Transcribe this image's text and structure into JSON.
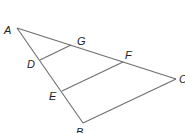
{
  "diagram": {
    "type": "triangle-with-parallel-segments",
    "points": {
      "A": {
        "x": 17,
        "y": 28,
        "label": "A",
        "lx": 4,
        "ly": 34
      },
      "B": {
        "x": 83,
        "y": 123,
        "label": "B",
        "lx": 76,
        "ly": 136
      },
      "C": {
        "x": 176,
        "y": 79,
        "label": "C",
        "lx": 179,
        "ly": 83
      },
      "D": {
        "x": 40,
        "y": 60,
        "label": "D",
        "lx": 27,
        "ly": 68
      },
      "E": {
        "x": 62,
        "y": 91,
        "label": "E",
        "lx": 49,
        "ly": 100
      },
      "F": {
        "x": 123,
        "y": 62,
        "label": "F",
        "lx": 125,
        "ly": 59
      },
      "G": {
        "x": 71,
        "y": 45,
        "label": "G",
        "lx": 77,
        "ly": 45
      }
    },
    "segments": [
      {
        "name": "side-AB",
        "from": "A",
        "to": "B"
      },
      {
        "name": "side-AC",
        "from": "A",
        "to": "C"
      },
      {
        "name": "side-BC",
        "from": "B",
        "to": "C"
      },
      {
        "name": "segment-DG",
        "from": "D",
        "to": "G"
      },
      {
        "name": "segment-EF",
        "from": "E",
        "to": "F"
      }
    ],
    "labels": [
      "A",
      "B",
      "C",
      "D",
      "E",
      "F",
      "G"
    ]
  }
}
